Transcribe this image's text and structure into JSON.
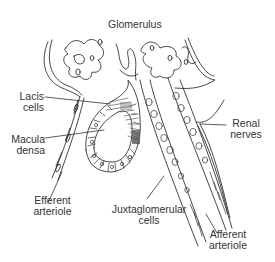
{
  "diagram": {
    "line_color": "#333333",
    "labels": {
      "glomerulus": "Glomerulus",
      "lacis_1": "Lacis",
      "lacis_2": "cells",
      "macula_1": "Macula",
      "macula_2": "densa",
      "efferent_1": "Efferent",
      "efferent_2": "arteriole",
      "jg_1": "Juxtaglomerular",
      "jg_2": "cells",
      "renal_1": "Renal",
      "renal_2": "nerves",
      "afferent_1": "Afferent",
      "afferent_2": "arteriole"
    }
  }
}
